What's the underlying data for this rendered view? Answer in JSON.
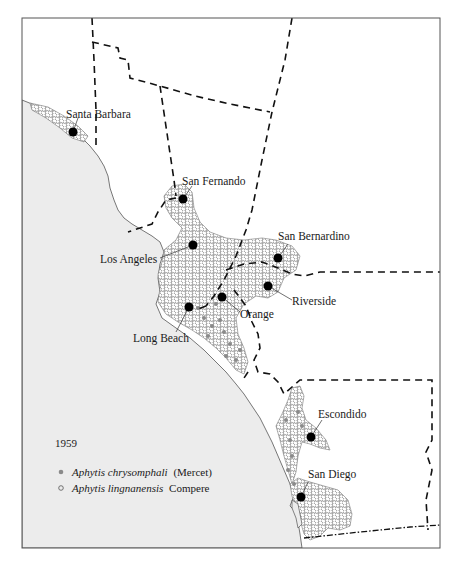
{
  "map": {
    "title_year": "1959",
    "colors": {
      "ocean": "#ececec",
      "land": "#ffffff",
      "frame": "#555555",
      "boundary": "#111111",
      "city_dot": "#000000",
      "chrysomphali_dot": "#8a8a8a",
      "lingnanensis_circle": "#777777"
    },
    "cities": [
      {
        "name": "Santa Barbara",
        "x": 73,
        "y": 132
      },
      {
        "name": "San Fernando",
        "x": 183,
        "y": 199
      },
      {
        "name": "Los Angeles",
        "x": 193,
        "y": 245
      },
      {
        "name": "San Bernardino",
        "x": 278,
        "y": 258
      },
      {
        "name": "Riverside",
        "x": 268,
        "y": 286
      },
      {
        "name": "Orange",
        "x": 222,
        "y": 297
      },
      {
        "name": "Long Beach",
        "x": 189,
        "y": 307
      },
      {
        "name": "Escondido",
        "x": 311,
        "y": 437
      },
      {
        "name": "San Diego",
        "x": 301,
        "y": 497
      }
    ],
    "labels": {
      "santa_barbara": "Santa Barbara",
      "san_fernando": "San Fernando",
      "los_angeles": "Los Angeles",
      "san_bernardino": "San Bernardino",
      "riverside": "Riverside",
      "orange": "Orange",
      "long_beach": "Long Beach",
      "escondido": "Escondido",
      "san_diego": "San Diego"
    }
  },
  "legend": {
    "year": "1959",
    "items": [
      {
        "symbol": "filled-gray-dot",
        "genus_species": "Aphytis chrysomphali",
        "authority": "(Mercet)"
      },
      {
        "symbol": "open-circle",
        "genus_species": "Aphytis lingnanensis",
        "authority": "Compere"
      }
    ]
  }
}
